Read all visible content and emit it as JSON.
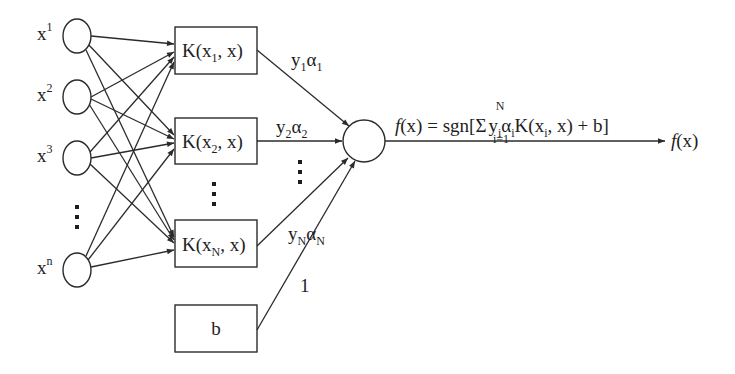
{
  "diagram": {
    "inputs": [
      {
        "id": "x1",
        "base": "x",
        "sup": "1",
        "cy": 36
      },
      {
        "id": "x2",
        "base": "x",
        "sup": "2",
        "cy": 97
      },
      {
        "id": "x3",
        "base": "x",
        "sup": "3",
        "cy": 158
      },
      {
        "id": "xn",
        "base": "x",
        "sup": "n",
        "cy": 270
      }
    ],
    "input_ellipsis": "⋮",
    "kernels": [
      {
        "id": "k1",
        "prefix": "K(x",
        "sub": "1",
        "suffix": ", x)",
        "y": 27
      },
      {
        "id": "k2",
        "prefix": "K(x",
        "sub": "2",
        "suffix": ", x)",
        "y": 118
      },
      {
        "id": "kN",
        "prefix": "K(x",
        "sub": "N",
        "suffix": ", x)",
        "y": 220
      }
    ],
    "kernel_ellipsis": "⋮",
    "bias_box": {
      "label": "b"
    },
    "weights": [
      {
        "id": "w1",
        "y": "y",
        "y_sub": "1",
        "a": "α",
        "a_sub": "1"
      },
      {
        "id": "w2",
        "y": "y",
        "y_sub": "2",
        "a": "α",
        "a_sub": "2"
      },
      {
        "id": "wN",
        "y": "y",
        "y_sub": "N",
        "a": "α",
        "a_sub": "N"
      }
    ],
    "weight_ellipsis": "⋮",
    "bias_weight": "1",
    "formula": {
      "lhs": "f",
      "lhs_arg": "(x) = sgn[",
      "sum": "Σ",
      "sum_upper": "N",
      "sum_lower": "i=1",
      "term_y": "y",
      "term_y_sub": "i",
      "term_a": "α",
      "term_a_sub": "i",
      "term_k": "K(x",
      "term_k_sub": "i",
      "term_rest": ", x) + b]"
    },
    "output": {
      "f": "f",
      "arg": "(x)"
    },
    "colors": {
      "line": "#2b2b2b",
      "text": "#1e1e1e",
      "background": "#ffffff"
    }
  }
}
